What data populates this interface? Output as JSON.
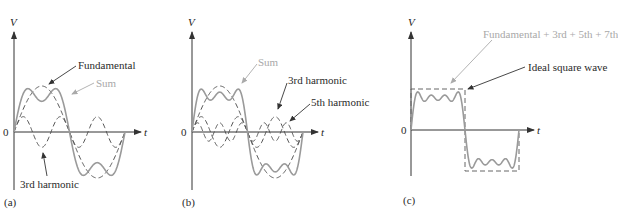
{
  "chart_data": [
    {
      "type": "line",
      "panel": "(a)",
      "title": "",
      "xlabel": "t",
      "ylabel": "V",
      "origin_label": "0",
      "grid": false,
      "description": "Fundamental and 3rd harmonic summed into a rough square wave over one period",
      "series": [
        {
          "name": "Fundamental",
          "harmonics": [
            1
          ],
          "amplitude": 1.0,
          "style": "dashed"
        },
        {
          "name": "3rd harmonic",
          "harmonics": [
            3
          ],
          "amplitude": 0.333,
          "style": "dashed"
        },
        {
          "name": "Sum",
          "harmonics": [
            1,
            3
          ],
          "style": "solid-gray"
        }
      ],
      "annotations": [
        "Fundamental",
        "Sum",
        "3rd harmonic"
      ]
    },
    {
      "type": "line",
      "panel": "(b)",
      "xlabel": "t",
      "ylabel": "V",
      "origin_label": "0",
      "grid": false,
      "series": [
        {
          "name": "Fundamental",
          "harmonics": [
            1
          ],
          "amplitude": 1.0,
          "style": "dashed"
        },
        {
          "name": "3rd harmonic",
          "harmonics": [
            3
          ],
          "amplitude": 0.333,
          "style": "dashed"
        },
        {
          "name": "5th harmonic",
          "harmonics": [
            5
          ],
          "amplitude": 0.2,
          "style": "dashed"
        },
        {
          "name": "Sum",
          "harmonics": [
            1,
            3,
            5
          ],
          "style": "solid-gray"
        }
      ],
      "annotations": [
        "Sum",
        "3rd harmonic",
        "5th harmonic"
      ]
    },
    {
      "type": "line",
      "panel": "(c)",
      "xlabel": "t",
      "ylabel": "V",
      "origin_label": "0",
      "grid": false,
      "series": [
        {
          "name": "Fundamental + 3rd + 5th + 7th",
          "harmonics": [
            1,
            3,
            5,
            7
          ],
          "style": "solid-gray"
        },
        {
          "name": "Ideal square wave",
          "style": "dashed"
        }
      ],
      "annotations": [
        "Fundamental + 3rd + 5th + 7th",
        "Ideal square wave"
      ]
    }
  ],
  "panels": {
    "a": {
      "label": "(a)",
      "y_axis": "V",
      "x_axis": "t",
      "origin": "0",
      "fundamental_label": "Fundamental",
      "sum_label": "Sum",
      "third_label": "3rd harmonic"
    },
    "b": {
      "label": "(b)",
      "y_axis": "V",
      "x_axis": "t",
      "origin": "0",
      "sum_label": "Sum",
      "third_label": "3rd harmonic",
      "fifth_label": "5th harmonic"
    },
    "c": {
      "label": "(c)",
      "y_axis": "V",
      "x_axis": "t",
      "origin": "0",
      "sum_label": "Fundamental + 3rd + 5th + 7th",
      "square_label": "Ideal square wave"
    }
  },
  "colors": {
    "sum_curve": "#9a9a9a",
    "harmonic_curve": "#555555",
    "axis": "#333333",
    "label_dark": "#2a2a2a",
    "label_light": "#a8a8a8"
  }
}
